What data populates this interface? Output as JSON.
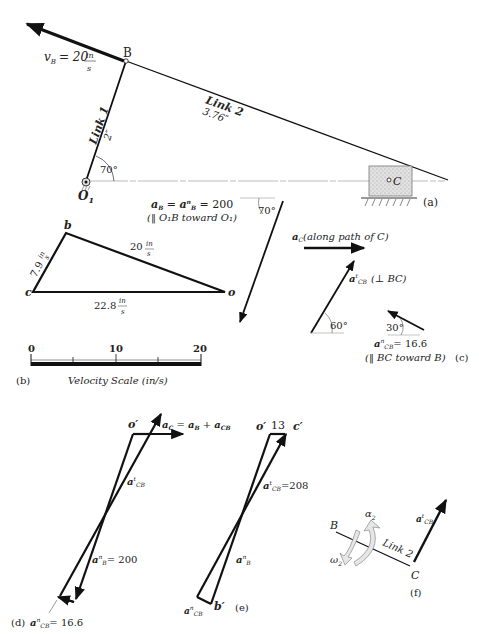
{
  "panel_a": {
    "label": "(a)",
    "vb_label": "v",
    "vb_sub": "B",
    "vb_value": "= 20",
    "vb_unit_num": "in",
    "vb_unit_den": "s",
    "point_B": "B",
    "point_C": "C",
    "point_O1": "O",
    "point_O1_sub": "1",
    "link1_name": "Link 1",
    "link1_len": "2″",
    "link2_name": "Link 2",
    "link2_len": "3.76″",
    "angle": "70°"
  },
  "panel_b": {
    "label": "(b)",
    "vertex_b": "b",
    "vertex_c": "c",
    "vertex_o": "o",
    "side_bc_value": "7.9",
    "side_ob_value": "20",
    "side_oc_value": "22.8",
    "unit_num": "in",
    "unit_den": "s",
    "scale_ticks": [
      "0",
      "10",
      "20"
    ],
    "scale_title": "Velocity Scale (in/s)"
  },
  "panel_c": {
    "label": "(c)",
    "aB_line1": "a",
    "aB_eq": "aʙ = aⁿʙ = 200",
    "aB_text": "aB = anB = 200",
    "aB_note": "(‖ O₁B toward O₁)",
    "aB_angle": "70°",
    "aC_text": "a",
    "aC_sub": "C",
    "aC_note": "(along path of C)",
    "atCB_text": "a",
    "atCB_sup": "t",
    "atCB_sub": "CB",
    "atCB_note": "(⊥ BC)",
    "atCB_angle": "60°",
    "anCB_angle": "30°",
    "anCB_sup": "n",
    "anCB_sub": "CB",
    "anCB_value": "= 16.6",
    "anCB_note": "(‖ BC toward B)"
  },
  "panel_d": {
    "label": "(d)",
    "o_prime": "o′",
    "eq_aC": "a",
    "eq_aC_sub": "C",
    "eq_rest": "= a",
    "eq_aB_sub": "B",
    "eq_plus": "+ a",
    "eq_aCB_sub": "CB",
    "atCB_sup": "t",
    "atCB_sub": "CB",
    "anB_sup": "n",
    "anB_sub": "B",
    "anB_value": "= 200",
    "anCB_sup": "n",
    "anCB_sub": "CB",
    "anCB_value": "= 16.6"
  },
  "panel_e": {
    "label": "(e)",
    "o_prime": "o′",
    "c_prime": "c′",
    "b_prime": "b′",
    "oc_value": "13",
    "atCB_sup": "t",
    "atCB_sub": "CB",
    "atCB_value": "=208",
    "anB_sup": "n",
    "anB_sub": "B",
    "anCB_sup": "n",
    "anCB_sub": "CB"
  },
  "panel_f": {
    "label": "(f)",
    "point_B": "B",
    "point_C": "C",
    "link_name": "Link 2",
    "alpha": "α",
    "alpha_sub": "2",
    "omega": "ω",
    "omega_sub": "2",
    "atCB_sup": "t",
    "atCB_sub": "CB"
  },
  "colors": {
    "ink": "#111111",
    "light_line": "#bbbbbb",
    "block_fill": "#d8d8d8",
    "arrow_fill": "#e6e6e6"
  }
}
